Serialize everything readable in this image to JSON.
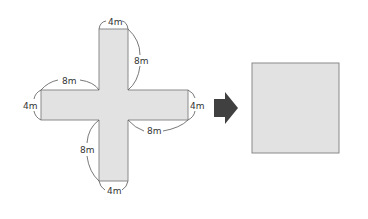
{
  "diagram": {
    "colors": {
      "shape_fill": "#e2e2e2",
      "shape_stroke": "#8a8a8a",
      "arrow": "#404040",
      "dimension_line": "#555555",
      "label_text": "#333333"
    },
    "cross": {
      "labels": {
        "top_width": "4m",
        "top_arm_length": "8m",
        "left_arm_length": "8m",
        "left_height": "4m",
        "right_height": "4m",
        "right_arm_length": "8m",
        "bottom_arm_length": "8m",
        "bottom_width": "4m"
      }
    },
    "arrow": {
      "direction": "right",
      "icon": "right-arrow-icon"
    },
    "square": {
      "label": ""
    }
  }
}
